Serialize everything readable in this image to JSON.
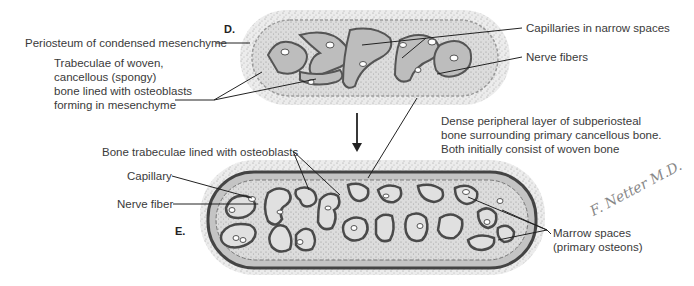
{
  "figure": {
    "panels": [
      {
        "id": "D",
        "letter": "D.",
        "labels": {
          "periosteum": "Periosteum of condensed mesenchyme",
          "trabeculae": [
            "Trabeculae of woven,",
            "cancellous (spongy)",
            "bone lined with osteoblasts",
            "forming in mesenchyme"
          ],
          "capillaries": "Capillaries in narrow spaces",
          "nerve_fibers": "Nerve fibers"
        }
      },
      {
        "id": "E",
        "letter": "E.",
        "labels": {
          "dense_layer": [
            "Dense peripheral layer of subperiosteal",
            "bone surrounding primary cancellous bone.",
            "Both initially consist of woven bone"
          ],
          "bone_trabeculae": "Bone trabeculae lined with osteoblasts",
          "capillary": "Capillary",
          "nerve_fiber": "Nerve fiber",
          "marrow_spaces": [
            "Marrow spaces",
            "(primary osteons)"
          ]
        }
      }
    ],
    "signature": "F. Netter M.D.",
    "colors": {
      "mesenchyme": "#d9d9d9",
      "bone_fill": "#b8b8b8",
      "bone_edge": "#555555",
      "leader": "#222222",
      "text": "#3a3a3a"
    }
  }
}
